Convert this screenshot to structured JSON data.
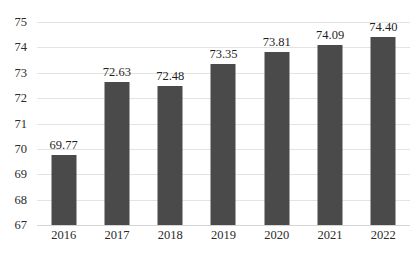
{
  "chart_data": {
    "type": "bar",
    "title": "",
    "subtitle": "",
    "xlabel": "",
    "ylabel": "",
    "categories": [
      "2016",
      "2017",
      "2018",
      "2019",
      "2020",
      "2021",
      "2022"
    ],
    "values": [
      69.77,
      72.63,
      72.48,
      73.35,
      73.81,
      74.09,
      74.4
    ],
    "data_labels": [
      "69.77",
      "72.63",
      "72.48",
      "73.35",
      "73.81",
      "74.09",
      "74.40"
    ],
    "ylim": [
      67,
      75
    ],
    "yticks": [
      67,
      68,
      69,
      70,
      71,
      72,
      73,
      74,
      75
    ],
    "ytick_labels": [
      "67",
      "68",
      "69",
      "70",
      "71",
      "72",
      "73",
      "74",
      "75"
    ],
    "grid": true,
    "grid_axis": "y",
    "legend": false,
    "legend_position": "none",
    "series": [
      {
        "name": "",
        "values": [
          69.77,
          72.63,
          72.48,
          73.35,
          73.81,
          74.09,
          74.4
        ]
      }
    ],
    "colors": {
      "bar": "#4a4a4a",
      "gridline": "#e3e3e3",
      "axis": "#d5d5d5",
      "text": "#2b2b2b",
      "background": "#ffffff"
    }
  }
}
